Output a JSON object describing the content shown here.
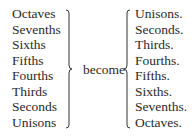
{
  "left_list": [
    "Octaves",
    "Sevenths",
    "Sixths",
    "Fifths",
    "Fourths",
    "Thirds",
    "Seconds",
    "Unisons"
  ],
  "connector": "become",
  "right_list": [
    "Unisons.",
    "Seconds.",
    "Thirds.",
    "Fourths.",
    "Fifths.",
    "Sixths.",
    "Sevenths.",
    "Octaves."
  ]
}
